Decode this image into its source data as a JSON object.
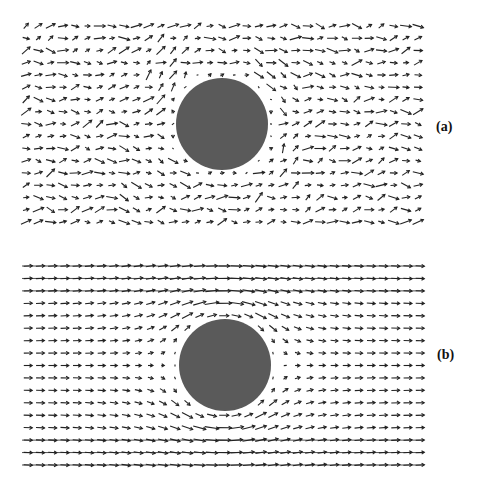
{
  "figure": {
    "panels": [
      {
        "id": "a",
        "label": "(a)",
        "description": "Vector field (noisy) around circular obstacle",
        "grid": {
          "x0": 26,
          "x1": 418,
          "y0": 26,
          "y1": 222,
          "cols": 33,
          "rows": 17
        },
        "obstacle": {
          "cx": 222,
          "cy": 124,
          "r": 46,
          "color": "#5a5a5a"
        },
        "style": "noisy"
      },
      {
        "id": "b",
        "label": "(b)",
        "description": "Smooth flow field around circular obstacle",
        "grid": {
          "x0": 28,
          "x1": 420,
          "y0": 266,
          "y1": 465,
          "cols": 33,
          "rows": 17
        },
        "obstacle": {
          "cx": 225,
          "cy": 365,
          "r": 46,
          "color": "#5a5a5a"
        },
        "style": "smooth"
      }
    ],
    "arrow_color": "#222222"
  }
}
